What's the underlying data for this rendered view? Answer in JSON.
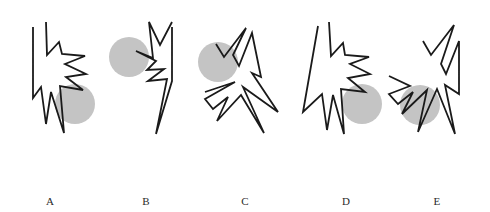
{
  "figure": {
    "canvas": {
      "width": 490,
      "height": 212,
      "background": "#ffffff"
    },
    "style": {
      "stroke_color": "#1a1a1a",
      "stroke_width": 1.8,
      "circle_fill": "#c4c4c4",
      "label_color": "#2a2a2a"
    },
    "items": [
      {
        "label": "A",
        "label_x": 50,
        "label_y": 205,
        "circle": {
          "cx": 75,
          "cy": 104,
          "r": 20
        },
        "polyline": "33,27 33,98 41,87 46,124 51,92 64,133 60,86 83,90 66,77 86,74 65,64 85,56 62,54 59,42 47,55 46,22"
      },
      {
        "label": "B",
        "label_x": 146,
        "label_y": 205,
        "circle": {
          "cx": 129,
          "cy": 57,
          "r": 20
        },
        "polyline": "172,22 160,45 149,22 153,58 136,51 156,61 147,70 164,69 148,81 167,79 156,134 172,81 172,27"
      },
      {
        "label": "C",
        "label_x": 245,
        "label_y": 205,
        "circle": {
          "cx": 218,
          "cy": 62,
          "r": 20
        },
        "polyline": "205,92 235,82 205,99 213,109 228,97 217,121 241,95 264,133 243,87 278,112 252,73 261,77 252,33 239,66 233,55 246,28 224,57 216,44"
      },
      {
        "label": "D",
        "label_x": 346,
        "label_y": 205,
        "circle": {
          "cx": 362,
          "cy": 104,
          "r": 20
        },
        "polyline": "318,26 303,112 322,94 327,130 333,95 344,134 341,89 365,92 348,78 370,74 350,64 369,57 345,55 343,43 331,56 329,22"
      },
      {
        "label": "E",
        "label_x": 437,
        "label_y": 205,
        "circle": {
          "cx": 420,
          "cy": 105,
          "r": 20
        },
        "polyline": "389,76 410,86 389,94 398,104 413,92 402,114 427,90 418,132 437,89 455,134 445,85 459,94 459,41 446,74 441,64 454,25 431,55 423,41"
      }
    ]
  }
}
